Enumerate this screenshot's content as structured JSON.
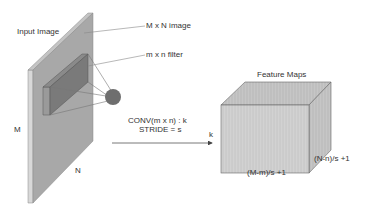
{
  "labels": {
    "input_image": "Input Image",
    "image_size": "M x N  image",
    "filter_size": "m x n  filter",
    "M": "M",
    "N": "N",
    "conv": "CONV(m x n) : k",
    "stride": "STRIDE = s",
    "k": "k",
    "feature_maps": "Feature Maps",
    "width_out": "(M-m)/s +1",
    "height_out": "(N-n)/s +1"
  },
  "colors": {
    "panel_face": "#a8a8a8",
    "panel_edge": "#d6d6d6",
    "filter_face": "#7c7c7c",
    "filter_side": "#959595",
    "neuron": "#6e6e6e",
    "cube_front": "#d4d4d4",
    "cube_top": "#c8c8c8",
    "cube_side": "#bdbdbd",
    "line": "#777777"
  }
}
